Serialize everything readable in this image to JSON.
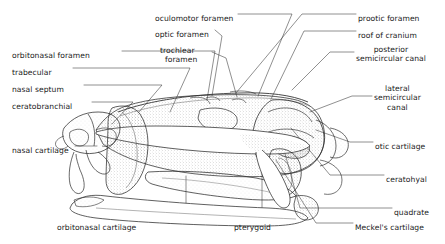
{
  "figure": {
    "style": "pen-and-ink stipple anatomical drawing",
    "ink_color": "#2b2b2b",
    "background_color": "#ffffff",
    "leader_color": "#333333"
  },
  "labels": [
    {
      "id": "oculomotor-foramen",
      "text": "oculomotor foramen",
      "lines": [
        "oculomotor foramen"
      ],
      "x": 155,
      "y": 14,
      "align": "left"
    },
    {
      "id": "optic-foramen",
      "text": "optic foramen",
      "lines": [
        "optic foramen"
      ],
      "x": 155,
      "y": 30,
      "align": "left"
    },
    {
      "id": "trochlear-foramen",
      "text": "trochlear foramen",
      "lines": [
        "trochlear",
        "foramen"
      ],
      "x": 160,
      "y": 46,
      "align": "left"
    },
    {
      "id": "prootic-foramen",
      "text": "prootic foramen",
      "lines": [
        "prootic foramen"
      ],
      "x": 358,
      "y": 14,
      "align": "left"
    },
    {
      "id": "roof-of-cranium",
      "text": "roof of cranium",
      "lines": [
        "roof of cranium"
      ],
      "x": 358,
      "y": 31,
      "align": "left"
    },
    {
      "id": "posterior-semicircular-canal",
      "text": "posterior semicircular canal",
      "lines": [
        "posterior",
        "semicircular canal"
      ],
      "x": 356,
      "y": 45,
      "align": "left"
    },
    {
      "id": "lateral-semicircular-canal",
      "text": "lateral semicircular canal",
      "lines": [
        "lateral",
        "semicircular",
        "canal"
      ],
      "x": 374,
      "y": 84,
      "align": "center"
    },
    {
      "id": "otic-cartilage",
      "text": "otic cartilage",
      "lines": [
        "otic cartilage"
      ],
      "x": 375,
      "y": 142,
      "align": "left"
    },
    {
      "id": "ceratohyal",
      "text": "ceratohyal",
      "lines": [
        "ceratohyal"
      ],
      "x": 386,
      "y": 175,
      "align": "left"
    },
    {
      "id": "quadrate",
      "text": "quadrate",
      "lines": [
        "quadrate"
      ],
      "x": 394,
      "y": 208,
      "align": "left"
    },
    {
      "id": "meckels-cartilage",
      "text": "Meckel's  cartilage",
      "lines": [
        "Meckel's  cartilage"
      ],
      "x": 355,
      "y": 223,
      "align": "left"
    },
    {
      "id": "orbitonasal-foramen",
      "text": "orbitonasal foramen",
      "lines": [
        "orbitonasal foramen"
      ],
      "x": 12,
      "y": 51,
      "align": "left"
    },
    {
      "id": "trabecular",
      "text": "trabecular",
      "lines": [
        "trabecular"
      ],
      "x": 12,
      "y": 68,
      "align": "left"
    },
    {
      "id": "nasal-septum",
      "text": "nasal septum",
      "lines": [
        "nasal septum"
      ],
      "x": 12,
      "y": 85,
      "align": "left"
    },
    {
      "id": "ceratobranchial",
      "text": "ceratobranchial",
      "lines": [
        "ceratobranchial"
      ],
      "x": 12,
      "y": 102,
      "align": "left"
    },
    {
      "id": "nasal-cartilage",
      "text": "nasal cartilage",
      "lines": [
        "nasal cartilage"
      ],
      "x": 12,
      "y": 146,
      "align": "left"
    },
    {
      "id": "orbitonasal-cartilage",
      "text": "orbitonasal cartilage",
      "lines": [
        "orbitonasal cartilage"
      ],
      "x": 57,
      "y": 223,
      "align": "left"
    },
    {
      "id": "pterygoid",
      "text": "pterygoid",
      "lines": [
        "pterygoid"
      ],
      "x": 234,
      "y": 223,
      "align": "left"
    }
  ]
}
